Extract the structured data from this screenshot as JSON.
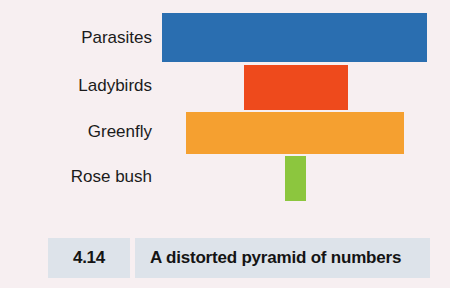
{
  "figure": {
    "background_color": "#f7eff1",
    "caption": {
      "number": "4.14",
      "text": "A distorted pyramid of numbers",
      "band_color": "#dde3ea"
    }
  },
  "chart_data": {
    "type": "bar",
    "title": "A distorted pyramid of numbers",
    "orientation": "horizontal-centered-pyramid",
    "xlabel": "",
    "ylabel": "",
    "grid": false,
    "legend": "none",
    "categories": [
      "Parasites",
      "Ladybirds",
      "Greenfly",
      "Rose bush"
    ],
    "values": [
      265,
      104,
      218,
      21
    ],
    "value_units": "relative bar width in pixels (number of organisms, unscaled)",
    "series": [
      {
        "name": "Number of organisms",
        "values": [
          265,
          104,
          218,
          21
        ]
      }
    ],
    "bars": [
      {
        "label": "Parasites",
        "trophic_level": 4,
        "width": 265,
        "color": "#2a6eb0",
        "color_name": "blue"
      },
      {
        "label": "Ladybirds",
        "trophic_level": 3,
        "width": 104,
        "color": "#ee4a1c",
        "color_name": "red"
      },
      {
        "label": "Greenfly",
        "trophic_level": 2,
        "width": 218,
        "color": "#f5a030",
        "color_name": "orange"
      },
      {
        "label": "Rose bush",
        "trophic_level": 1,
        "width": 21,
        "color": "#8cc63e",
        "color_name": "green"
      }
    ]
  }
}
